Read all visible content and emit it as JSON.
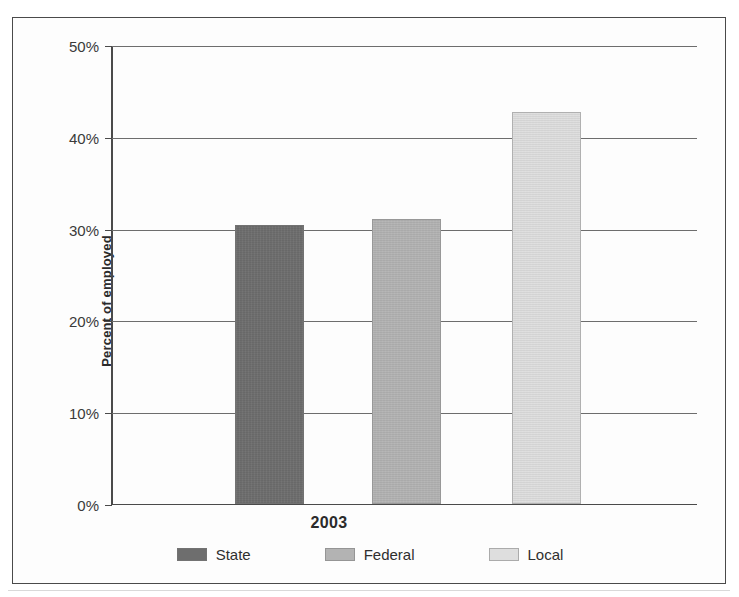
{
  "figure": {
    "clipped_caption": "",
    "background_color": "#fdfdfd",
    "border_color": "#4a4a4a"
  },
  "chart_data": {
    "type": "bar",
    "title": "",
    "subtitle": "",
    "xlabel": "",
    "ylabel": "Percent of employed",
    "categories": [
      "2003"
    ],
    "ylim": [
      0,
      50
    ],
    "ytick_labels": [
      "0%",
      "10%",
      "20%",
      "30%",
      "40%",
      "50%"
    ],
    "ytick_values": [
      0,
      10,
      20,
      30,
      40,
      50
    ],
    "grid": true,
    "legend_position": "bottom",
    "value_suffix": "%",
    "series": [
      {
        "name": "State",
        "values": [
          30.3
        ],
        "color": "#6e6e6e"
      },
      {
        "name": "Federal",
        "values": [
          31.0
        ],
        "color": "#b3b3b3"
      },
      {
        "name": "Local",
        "values": [
          42.7
        ],
        "color": "#dedede"
      }
    ]
  }
}
